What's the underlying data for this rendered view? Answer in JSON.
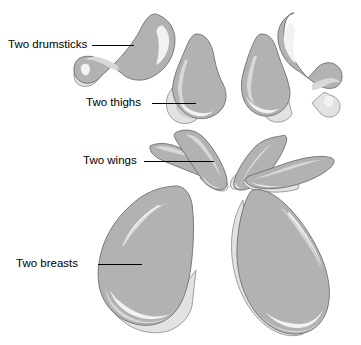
{
  "figure": {
    "background_color": "#ffffff",
    "meat_fill_color": "#b2b2b2",
    "skin_fill_color": "#e2e2e2",
    "highlight_color": "#f2f2f2",
    "outline_color": "#6f6f6f",
    "label_text_color": "#000000",
    "leader_line_color": "#000000"
  },
  "labels": [
    {
      "id": "drumsticks",
      "text": "Two drumsticks",
      "count": 2,
      "part": "drumstick"
    },
    {
      "id": "thighs",
      "text": "Two thighs",
      "count": 2,
      "part": "thigh"
    },
    {
      "id": "wings",
      "text": "Two wings",
      "count": 2,
      "part": "wing"
    },
    {
      "id": "breasts",
      "text": "Two breasts",
      "count": 2,
      "part": "breast"
    }
  ],
  "parts": [
    {
      "id": "drumstick-left",
      "name": "drumstick",
      "side": "left"
    },
    {
      "id": "drumstick-right",
      "name": "drumstick",
      "side": "right"
    },
    {
      "id": "thigh-left",
      "name": "thigh",
      "side": "left"
    },
    {
      "id": "thigh-right",
      "name": "thigh",
      "side": "right"
    },
    {
      "id": "wing-left",
      "name": "wing",
      "side": "left"
    },
    {
      "id": "wing-left-inner",
      "name": "wing",
      "side": "left-inner"
    },
    {
      "id": "wing-right-inner",
      "name": "wing",
      "side": "right-inner"
    },
    {
      "id": "wing-right",
      "name": "wing",
      "side": "right"
    },
    {
      "id": "breast-left",
      "name": "breast",
      "side": "left"
    },
    {
      "id": "breast-right",
      "name": "breast",
      "side": "right"
    }
  ]
}
